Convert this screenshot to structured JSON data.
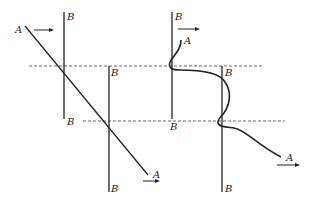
{
  "diagram": {
    "colors": {
      "ink": "#222222",
      "dashed": "#555555",
      "background": "#ffffff"
    },
    "left_panel": {
      "line_A_label_start": "A",
      "line_A_label_end": "A",
      "boundary_1_top_label": "B",
      "boundary_1_bottom_label": "B",
      "boundary_2_top_label": "B",
      "boundary_2_bottom_label": "B"
    },
    "right_panel": {
      "curve_A_label_start": "A",
      "curve_A_label_end": "A",
      "boundary_1_top_label": "B",
      "boundary_1_bottom_label": "B",
      "boundary_2_top_label": "B",
      "boundary_2_bottom_label": "B"
    },
    "arrows": [
      "arrow-right",
      "arrow-right",
      "arrow-right",
      "arrow-right"
    ]
  }
}
